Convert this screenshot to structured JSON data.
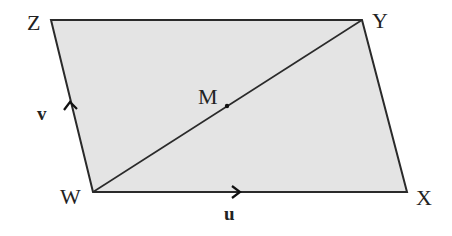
{
  "diagram": {
    "type": "parallelogram",
    "fill_color": "#e4e4e4",
    "stroke_color": "#2a2a2a",
    "vertices": {
      "Z": {
        "label": "Z",
        "x": 51,
        "y": 20
      },
      "Y": {
        "label": "Y",
        "x": 362,
        "y": 20
      },
      "X": {
        "label": "X",
        "x": 407,
        "y": 192
      },
      "W": {
        "label": "W",
        "x": 93,
        "y": 192
      }
    },
    "diagonal": {
      "from": "W",
      "to": "Y"
    },
    "midpoint": {
      "label": "M",
      "x": 227,
      "y": 106
    },
    "vectors": {
      "u": {
        "label": "u",
        "along": "WX",
        "direction": "right"
      },
      "v": {
        "label": "v",
        "along": "WZ",
        "direction": "up"
      }
    }
  }
}
